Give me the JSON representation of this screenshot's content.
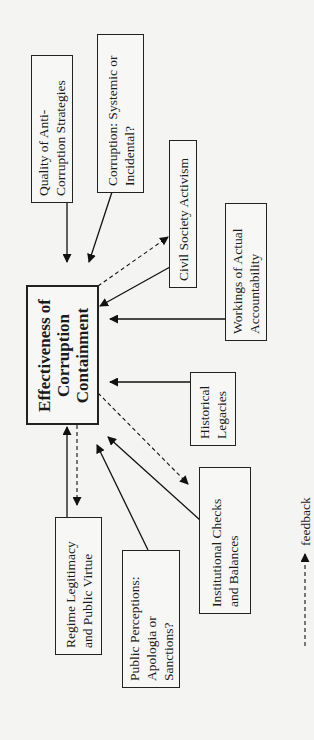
{
  "diagram": {
    "central": {
      "lines": [
        "Effectiveness of",
        "Corruption",
        "Containment"
      ]
    },
    "factors": [
      {
        "id": "quality",
        "lines": [
          "Quality of Anti-",
          "Corruption Strategies"
        ]
      },
      {
        "id": "systemic",
        "lines": [
          "Corruption: Systemic or",
          "Incidental?"
        ]
      },
      {
        "id": "civil",
        "lines": [
          "Civil Society Activism"
        ]
      },
      {
        "id": "workings",
        "lines": [
          "Workings of Actual",
          "Accountability"
        ]
      },
      {
        "id": "historical",
        "lines": [
          "Historical",
          "Legacies"
        ]
      },
      {
        "id": "institutional",
        "lines": [
          "Institutional Checks",
          "and Balances"
        ]
      },
      {
        "id": "public",
        "lines": [
          "Public Perceptions:",
          "Apologia or",
          "Sanctions?"
        ]
      },
      {
        "id": "regime",
        "lines": [
          "Regime Legitimacy",
          "and Public Virtue"
        ]
      }
    ],
    "legend": {
      "label": "feedback",
      "style": "dashed-arrow"
    }
  }
}
